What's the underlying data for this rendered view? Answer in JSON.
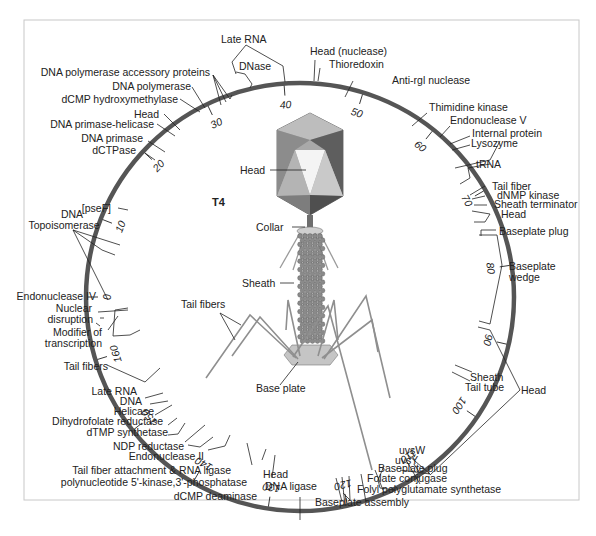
{
  "title": "T4",
  "colors": {
    "ring": "#555555",
    "line": "#222222",
    "frame": "#c8c8c8",
    "head_dark": "#7a7a7a",
    "head_mid": "#a9a9a9",
    "head_light": "#d6d6d6",
    "sheath": "#8a8a8a",
    "fiber": "#9a9a9a"
  },
  "genome": {
    "total_kb": 168,
    "ticks": [
      0,
      10,
      20,
      30,
      40,
      50,
      60,
      70,
      80,
      90,
      100,
      110,
      120,
      130,
      140,
      150,
      160
    ]
  },
  "phage_labels": {
    "head": "Head",
    "collar": "Collar",
    "sheath": "Sheath",
    "tail_fibers": "Tail fibers",
    "base_plate": "Base plate"
  },
  "gene_labels": [
    {
      "text": "Late RNA"
    },
    {
      "text": "DNase"
    },
    {
      "text": "DNA polymerase accessory proteins"
    },
    {
      "text": "DNA polymerase"
    },
    {
      "text": "dCMP hydroxymethylase"
    },
    {
      "text": "Head"
    },
    {
      "text": "DNA primase-helicase"
    },
    {
      "text": "DNA primase"
    },
    {
      "text": "dCTPase"
    },
    {
      "text": "[pseF]"
    },
    {
      "text": "DNA"
    },
    {
      "text": "Topoisomerase"
    },
    {
      "text": "Endonuclease IV"
    },
    {
      "text": "Nuclear"
    },
    {
      "text": "disruption"
    },
    {
      "text": "Modifier of"
    },
    {
      "text": "transcription"
    },
    {
      "text": "Tail fibers"
    },
    {
      "text": "Late RNA"
    },
    {
      "text": "DNA"
    },
    {
      "text": "Helicase"
    },
    {
      "text": "Dihydrofolate reductase"
    },
    {
      "text": "dTMP synthetase"
    },
    {
      "text": "NDP reductase"
    },
    {
      "text": "Endonuclease II"
    },
    {
      "text": "Tail fiber attachment & RNA ligase"
    },
    {
      "text": "polynucleotide 5'-kinase,3'-phosphatase"
    },
    {
      "text": "dCMP deaminase"
    },
    {
      "text": "Head"
    },
    {
      "text": "DNA ligase"
    },
    {
      "text": "Baseplate assembly"
    },
    {
      "text": "Folyl polyglutamate synthetase"
    },
    {
      "text": "Folate conjugase"
    },
    {
      "text": "Baseplate plug"
    },
    {
      "text": "uvsY"
    },
    {
      "text": "uvsW"
    },
    {
      "text": "Head"
    },
    {
      "text": "Sheath"
    },
    {
      "text": "Tail tube"
    },
    {
      "text": "Baseplate"
    },
    {
      "text": "wedge"
    },
    {
      "text": "Baseplate plug"
    },
    {
      "text": "Head"
    },
    {
      "text": "Sheath terminator"
    },
    {
      "text": "dNMP kinase"
    },
    {
      "text": "Tail fiber"
    },
    {
      "text": "tRNA"
    },
    {
      "text": "Lysozyme"
    },
    {
      "text": "Internal protein"
    },
    {
      "text": "Endonuclease V"
    },
    {
      "text": "Thimidine kinase"
    },
    {
      "text": "Anti-rgl nuclease"
    },
    {
      "text": "Thioredoxin"
    },
    {
      "text": "Head (nuclease)"
    }
  ]
}
